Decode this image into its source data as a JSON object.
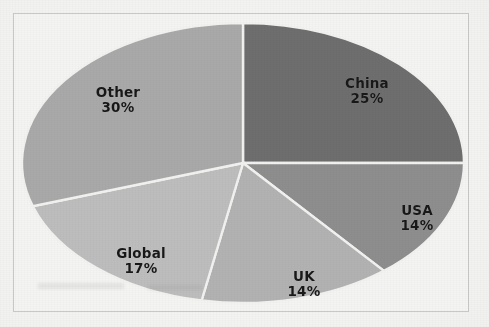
{
  "chart_data": {
    "type": "pie",
    "title": "",
    "labels": [
      "China",
      "USA",
      "UK",
      "Global",
      "Other"
    ],
    "values": [
      25,
      14,
      14,
      17,
      30
    ],
    "value_labels": [
      "25%",
      "14%",
      "14%",
      "17%",
      "30%"
    ],
    "units": "percent",
    "total": 100,
    "start_angle_deg": 0,
    "direction": "clockwise",
    "legend": "none",
    "data_labels_position": "inside",
    "grid": false,
    "slices": [
      {
        "label": "China",
        "value": 25,
        "value_label": "25%",
        "color": "#6e6e6e",
        "start_deg": 0,
        "end_deg": 90
      },
      {
        "label": "USA",
        "value": 14,
        "value_label": "14%",
        "color": "#8e8e8e",
        "start_deg": 90,
        "end_deg": 140.4
      },
      {
        "label": "UK",
        "value": 14,
        "value_label": "14%",
        "color": "#b2b2b2",
        "start_deg": 140.4,
        "end_deg": 190.8
      },
      {
        "label": "Global",
        "value": 17,
        "value_label": "17%",
        "color": "#bdbdbd",
        "start_deg": 190.8,
        "end_deg": 252
      },
      {
        "label": "Other",
        "value": 30,
        "value_label": "30%",
        "color": "#a9a9a9",
        "start_deg": 252,
        "end_deg": 360
      }
    ]
  },
  "chart": {
    "slice_separator_color": "#f2f2f0",
    "background_color": "#f4f4f2",
    "frame_color": "#c9c9c7",
    "label_text_color": "#181818"
  }
}
